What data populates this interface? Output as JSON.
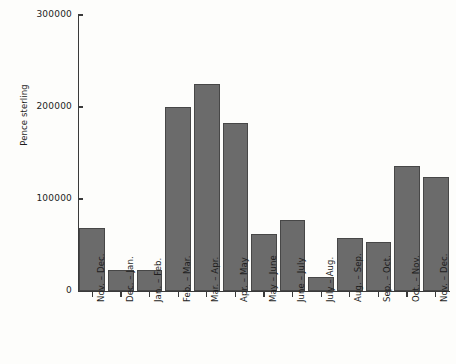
{
  "chart_data": {
    "type": "bar",
    "title": "",
    "subtitle": "",
    "xlabel": "",
    "ylabel": "Pence sterling",
    "ylim": [
      0,
      300000
    ],
    "ytick_labels": [
      "300000",
      "200000",
      "100000",
      "0"
    ],
    "yticks": [
      300000,
      200000,
      100000,
      0
    ],
    "grid": false,
    "legend": null,
    "bar_color": "#6b6b6b",
    "bar_edge_color": "#474747",
    "background_color": "#fdfdfb",
    "axis_color": "#3a3a3a",
    "categories": [
      "Nov. – Dec.",
      "Dec. – Jan.",
      "Jan. – Feb.",
      "Feb. – Mar.",
      "Mar. – Apr.",
      "Apr. – May",
      "May – June",
      "June – July",
      "July – Aug.",
      "Aug. – Sep.",
      "Sep. – Oct.",
      "Oct. – Nov.",
      "Nov. – Dec."
    ],
    "values": [
      68000,
      23000,
      23000,
      200000,
      225000,
      183000,
      62000,
      77000,
      15000,
      58000,
      53000,
      136000,
      124000
    ]
  }
}
